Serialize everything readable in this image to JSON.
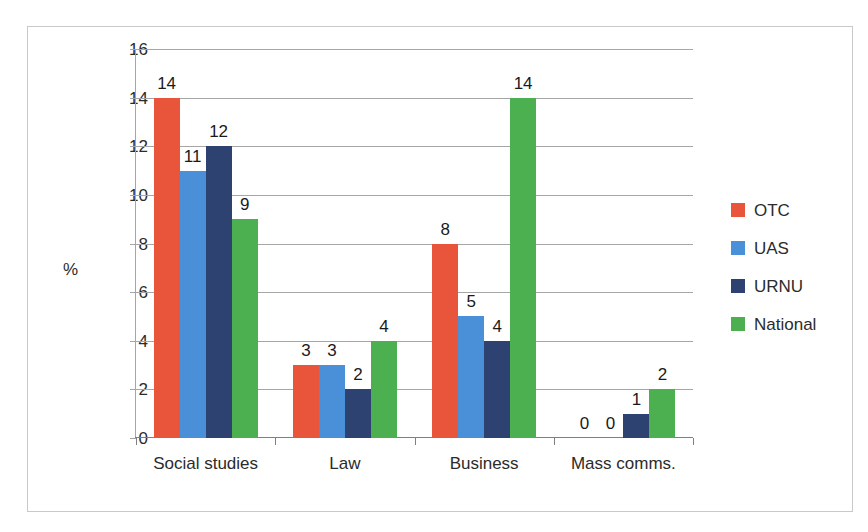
{
  "chart_data": {
    "type": "bar",
    "title": "",
    "xlabel": "",
    "ylabel": "%",
    "categories": [
      "Social studies",
      "Law",
      "Business",
      "Mass comms."
    ],
    "series": [
      {
        "name": "OTC",
        "color": "#E8553A",
        "values": [
          14,
          3,
          8,
          0
        ]
      },
      {
        "name": "UAS",
        "color": "#4A90D9",
        "values": [
          11,
          3,
          5,
          0
        ]
      },
      {
        "name": "URNU",
        "color": "#2E4272",
        "values": [
          12,
          2,
          4,
          1
        ]
      },
      {
        "name": "National",
        "color": "#4CAF50",
        "values": [
          9,
          4,
          14,
          2
        ]
      }
    ],
    "ylim": [
      0,
      16
    ],
    "ytick_step": 2,
    "yticks": [
      "16",
      "14",
      "12",
      "10",
      "8",
      "6",
      "4",
      "2",
      "0"
    ],
    "grid": true,
    "legend_position": "right",
    "show_data_labels": true
  }
}
